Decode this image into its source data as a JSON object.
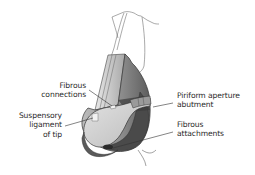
{
  "figure": {
    "labels": [
      {
        "id": "fibrous-connections",
        "lines": [
          "Fibrous",
          "connections"
        ],
        "side": "left"
      },
      {
        "id": "suspensory-ligament",
        "lines": [
          "Suspensory",
          "ligament",
          "of tip"
        ],
        "side": "left"
      },
      {
        "id": "piriform-aperture",
        "lines": [
          "Piriform aperture",
          "abutment"
        ],
        "side": "right"
      },
      {
        "id": "fibrous-attachments",
        "lines": [
          "Fibrous",
          "attachments"
        ],
        "side": "right"
      }
    ]
  },
  "colors": {
    "background": "#ffffff",
    "skin_light": "#d9d9d9",
    "cartilage": "#c8c8c8",
    "shadow_dark": "#4a4a4a",
    "outline": "#333333",
    "text": "#2a2a2a"
  }
}
